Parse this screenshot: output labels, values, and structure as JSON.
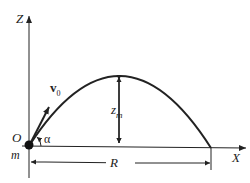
{
  "diagram": {
    "axes": {
      "x_label": "X",
      "z_label": "Z"
    },
    "origin_label": "O",
    "mass_label": "m",
    "velocity_label": "v",
    "velocity_subscript": "0",
    "angle_label": "α",
    "max_height_label": "z",
    "max_height_subscript": "m",
    "range_label": "R",
    "colors": {
      "line": "#222222",
      "background": "#ffffff"
    }
  }
}
